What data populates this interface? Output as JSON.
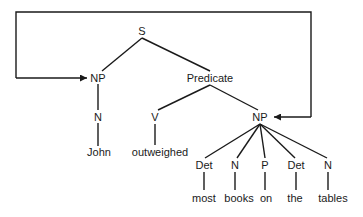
{
  "diagram": {
    "type": "parse-tree",
    "root": "S",
    "nodes": {
      "s": "S",
      "np_subject": "NP",
      "predicate": "Predicate",
      "n_subject": "N",
      "john": "John",
      "v": "V",
      "outweighed": "outweighed",
      "np_object": "NP",
      "det1": "Det",
      "n1": "N",
      "p": "P",
      "det2": "Det",
      "n2": "N",
      "most": "most",
      "books": "books",
      "on": "on",
      "the": "the",
      "tables": "tables"
    },
    "edges": [
      [
        "S",
        "NP"
      ],
      [
        "S",
        "Predicate"
      ],
      [
        "NP",
        "N"
      ],
      [
        "N",
        "John"
      ],
      [
        "Predicate",
        "V"
      ],
      [
        "Predicate",
        "NP"
      ],
      [
        "V",
        "outweighed"
      ],
      [
        "NP",
        "Det"
      ],
      [
        "NP",
        "N"
      ],
      [
        "NP",
        "P"
      ],
      [
        "NP",
        "Det"
      ],
      [
        "NP",
        "N"
      ],
      [
        "Det",
        "most"
      ],
      [
        "N",
        "books"
      ],
      [
        "P",
        "on"
      ],
      [
        "Det",
        "the"
      ],
      [
        "N",
        "tables"
      ]
    ],
    "connector": {
      "description": "bracket arrow linking subject NP and object NP",
      "arrows_to": [
        "NP (subject)",
        "NP (object)"
      ]
    }
  }
}
